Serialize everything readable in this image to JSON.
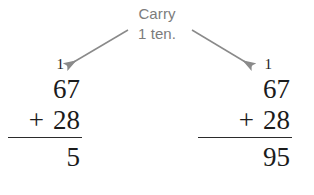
{
  "canvas": {
    "width": 314,
    "height": 195,
    "background": "#ffffff"
  },
  "caption": {
    "line1": "Carry",
    "line2": "1 ten.",
    "color": "#7c7c7c"
  },
  "arrows": {
    "color": "#8a8a8a",
    "left": {
      "label": "arrow pointing to left carry digit",
      "from_x": 128,
      "from_y": 30,
      "to_x": 63,
      "to_y": 69
    },
    "right": {
      "label": "arrow pointing to right carry digit",
      "from_x": 192,
      "from_y": 30,
      "to_x": 255,
      "to_y": 69
    }
  },
  "problems": [
    {
      "id": "left",
      "name": "incomplete-addition",
      "carry": "1",
      "addend": "67",
      "operator": "+",
      "operand": "28",
      "total": "5"
    },
    {
      "id": "right",
      "name": "completed-addition",
      "carry": "1",
      "addend": "67",
      "operator": "+",
      "operand": "28",
      "total": "95"
    }
  ],
  "math_color": "#1b1b1b",
  "rule_color": "#2b2b2b"
}
